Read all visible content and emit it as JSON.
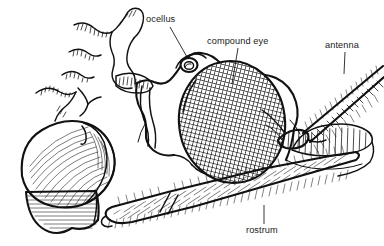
{
  "figure": {
    "background_color": "#ffffff",
    "ink_color": "#111111",
    "label_color": "#1a1a1a"
  },
  "labels": [
    {
      "id": "ocellus",
      "text": "ocellus",
      "text_x": 146,
      "text_y": 22,
      "leader": {
        "x1": 170,
        "y1": 27,
        "x2": 187,
        "y2": 57
      }
    },
    {
      "id": "compound-eye",
      "text": "compound eye",
      "text_x": 207,
      "text_y": 44,
      "leader": {
        "x1": 238,
        "y1": 48,
        "x2": 232,
        "y2": 84
      }
    },
    {
      "id": "antenna",
      "text": "antenna",
      "text_x": 325,
      "text_y": 48,
      "leader": {
        "x1": 345,
        "y1": 52,
        "x2": 344,
        "y2": 74
      }
    },
    {
      "id": "rostrum",
      "text": "rostrum",
      "text_x": 246,
      "text_y": 233,
      "leader": {
        "x1": 264,
        "y1": 205,
        "x2": 264,
        "y2": 224
      }
    }
  ],
  "structures": [
    {
      "id": "compound-eye-shape",
      "name": "compound eye",
      "description": "large ovoid eye with fine crosshatched ommatidia mesh"
    },
    {
      "id": "ocellus-shape",
      "name": "ocellus",
      "description": "small domed simple eye on top of head"
    },
    {
      "id": "antenna-shape",
      "name": "antenna",
      "description": "long segmented setose antenna projecting up-right"
    },
    {
      "id": "rostrum-shape",
      "name": "rostrum",
      "description": "long tapering beak with dense bristles, two segments"
    },
    {
      "id": "thorax-shape",
      "name": "thorax",
      "description": "wavy contour lines at upper left"
    },
    {
      "id": "leg-shape",
      "name": "foreleg coxa",
      "description": "rounded striated segment at lower left"
    },
    {
      "id": "clypeus-shape",
      "name": "clypeus",
      "description": "striated facial plate right of the eye"
    }
  ]
}
